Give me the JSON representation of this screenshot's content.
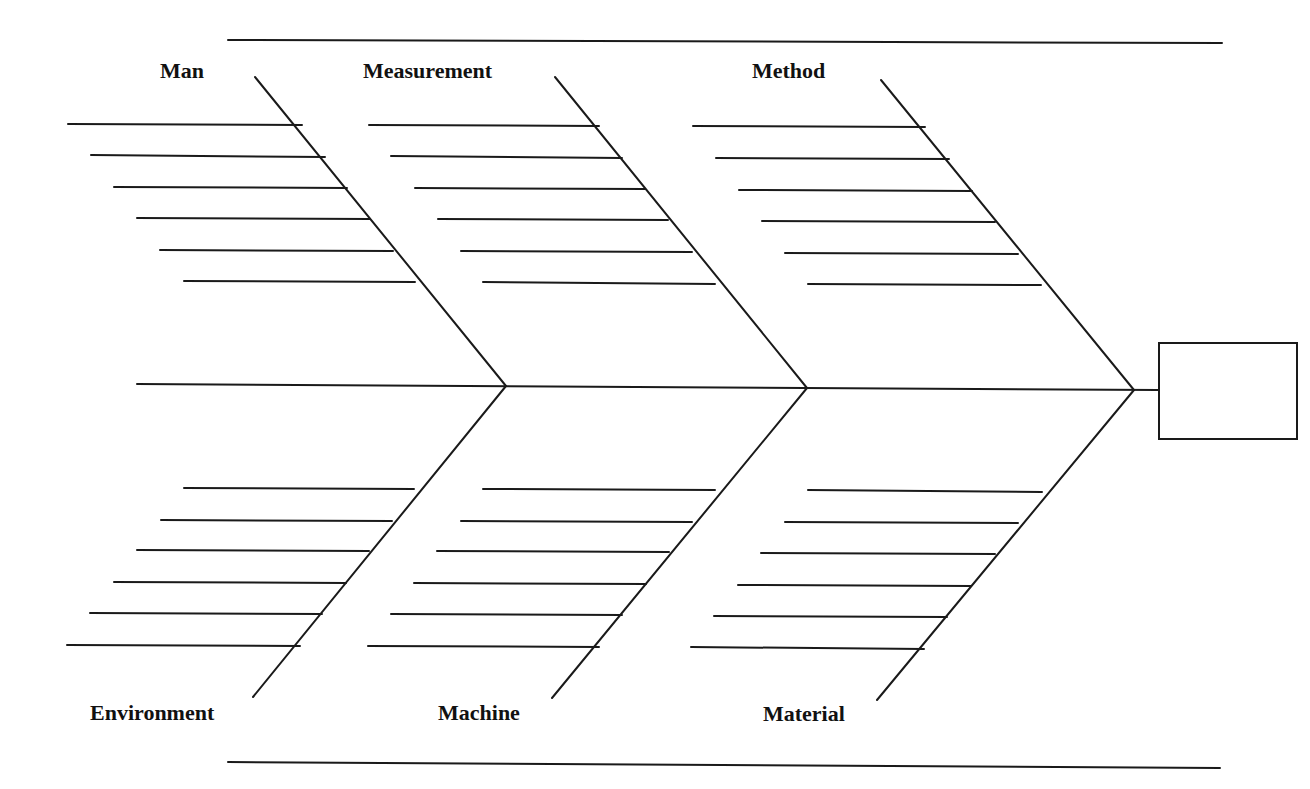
{
  "diagram": {
    "type": "fishbone",
    "title": "",
    "colors": {
      "line": "#1a1a1a",
      "text": "#111111",
      "background": "#ffffff"
    },
    "frame": {
      "top_rule": {
        "x1": 228,
        "y1": 40,
        "x2": 1222,
        "y2": 43
      },
      "bottom_rule": {
        "x1": 228,
        "y1": 762,
        "x2": 1220,
        "y2": 768
      }
    },
    "spine": {
      "x1": 137,
      "y1": 384,
      "x2": 1158,
      "y2": 390
    },
    "head": {
      "x": 1158,
      "y": 342,
      "width": 140,
      "height": 98,
      "text": ""
    },
    "categories": [
      {
        "id": "man",
        "label": "Man",
        "position": "top",
        "label_xy": [
          160,
          60
        ],
        "bone": {
          "x1": 255,
          "y1": 77,
          "x2": 506,
          "y2": 386
        },
        "ribs": [
          {
            "x1": 68,
            "y1": 124,
            "x2": 302,
            "y2": 125
          },
          {
            "x1": 91,
            "y1": 155,
            "x2": 325,
            "y2": 157
          },
          {
            "x1": 114,
            "y1": 187,
            "x2": 347,
            "y2": 188
          },
          {
            "x1": 137,
            "y1": 218,
            "x2": 370,
            "y2": 219
          },
          {
            "x1": 160,
            "y1": 250,
            "x2": 393,
            "y2": 251
          },
          {
            "x1": 184,
            "y1": 281,
            "x2": 415,
            "y2": 282
          }
        ],
        "causes": [
          "",
          "",
          "",
          "",
          "",
          ""
        ]
      },
      {
        "id": "measurement",
        "label": "Measurement",
        "position": "top",
        "label_xy": [
          363,
          60
        ],
        "bone": {
          "x1": 555,
          "y1": 77,
          "x2": 807,
          "y2": 388
        },
        "ribs": [
          {
            "x1": 369,
            "y1": 125,
            "x2": 599,
            "y2": 126
          },
          {
            "x1": 391,
            "y1": 156,
            "x2": 622,
            "y2": 158
          },
          {
            "x1": 415,
            "y1": 188,
            "x2": 645,
            "y2": 189
          },
          {
            "x1": 438,
            "y1": 219,
            "x2": 668,
            "y2": 220
          },
          {
            "x1": 461,
            "y1": 251,
            "x2": 692,
            "y2": 252
          },
          {
            "x1": 483,
            "y1": 282,
            "x2": 715,
            "y2": 284
          }
        ],
        "causes": [
          "",
          "",
          "",
          "",
          "",
          ""
        ]
      },
      {
        "id": "method",
        "label": "Method",
        "position": "top",
        "label_xy": [
          752,
          60
        ],
        "bone": {
          "x1": 881,
          "y1": 80,
          "x2": 1134,
          "y2": 390
        },
        "ribs": [
          {
            "x1": 693,
            "y1": 126,
            "x2": 925,
            "y2": 127
          },
          {
            "x1": 716,
            "y1": 158,
            "x2": 949,
            "y2": 159
          },
          {
            "x1": 739,
            "y1": 190,
            "x2": 972,
            "y2": 191
          },
          {
            "x1": 762,
            "y1": 221,
            "x2": 995,
            "y2": 222
          },
          {
            "x1": 785,
            "y1": 253,
            "x2": 1018,
            "y2": 254
          },
          {
            "x1": 808,
            "y1": 284,
            "x2": 1041,
            "y2": 285
          }
        ],
        "causes": [
          "",
          "",
          "",
          "",
          "",
          ""
        ]
      },
      {
        "id": "environment",
        "label": "Environment",
        "position": "bottom",
        "label_xy": [
          90,
          702
        ],
        "bone": {
          "x1": 506,
          "y1": 386,
          "x2": 253,
          "y2": 697
        },
        "ribs": [
          {
            "x1": 184,
            "y1": 488,
            "x2": 414,
            "y2": 489
          },
          {
            "x1": 161,
            "y1": 520,
            "x2": 392,
            "y2": 521
          },
          {
            "x1": 137,
            "y1": 550,
            "x2": 369,
            "y2": 551
          },
          {
            "x1": 114,
            "y1": 582,
            "x2": 346,
            "y2": 583
          },
          {
            "x1": 90,
            "y1": 613,
            "x2": 322,
            "y2": 614
          },
          {
            "x1": 67,
            "y1": 645,
            "x2": 300,
            "y2": 646
          }
        ],
        "causes": [
          "",
          "",
          "",
          "",
          "",
          ""
        ]
      },
      {
        "id": "machine",
        "label": "Machine",
        "position": "bottom",
        "label_xy": [
          438,
          702
        ],
        "bone": {
          "x1": 807,
          "y1": 388,
          "x2": 552,
          "y2": 698
        },
        "ribs": [
          {
            "x1": 483,
            "y1": 489,
            "x2": 715,
            "y2": 490
          },
          {
            "x1": 461,
            "y1": 521,
            "x2": 692,
            "y2": 522
          },
          {
            "x1": 437,
            "y1": 551,
            "x2": 669,
            "y2": 552
          },
          {
            "x1": 414,
            "y1": 583,
            "x2": 646,
            "y2": 584
          },
          {
            "x1": 391,
            "y1": 614,
            "x2": 622,
            "y2": 615
          },
          {
            "x1": 368,
            "y1": 646,
            "x2": 599,
            "y2": 647
          }
        ],
        "causes": [
          "",
          "",
          "",
          "",
          "",
          ""
        ]
      },
      {
        "id": "material",
        "label": "Material",
        "position": "bottom",
        "label_xy": [
          763,
          703
        ],
        "bone": {
          "x1": 1134,
          "y1": 390,
          "x2": 877,
          "y2": 700
        },
        "ribs": [
          {
            "x1": 808,
            "y1": 490,
            "x2": 1042,
            "y2": 492
          },
          {
            "x1": 785,
            "y1": 522,
            "x2": 1018,
            "y2": 523
          },
          {
            "x1": 761,
            "y1": 553,
            "x2": 995,
            "y2": 554
          },
          {
            "x1": 738,
            "y1": 585,
            "x2": 971,
            "y2": 586
          },
          {
            "x1": 714,
            "y1": 616,
            "x2": 947,
            "y2": 617
          },
          {
            "x1": 691,
            "y1": 647,
            "x2": 924,
            "y2": 649
          }
        ],
        "causes": [
          "",
          "",
          "",
          "",
          "",
          ""
        ]
      }
    ]
  }
}
